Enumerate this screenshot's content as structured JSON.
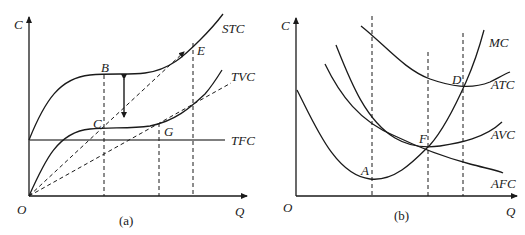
{
  "panel_a": {
    "caption": "(a)",
    "y_axis_label": "C",
    "x_axis_label": "Q",
    "origin_label": "O",
    "curves": {
      "stc": "STC",
      "tvc": "TVC",
      "tfc": "TFC"
    },
    "points": {
      "b": "B",
      "c": "C",
      "e": "E",
      "g": "G"
    }
  },
  "panel_b": {
    "caption": "(b)",
    "y_axis_label": "C",
    "x_axis_label": "Q",
    "origin_label": "O",
    "curves": {
      "mc": "MC",
      "atc": "ATC",
      "avc": "AVC",
      "afc": "AFC"
    },
    "points": {
      "a": "A",
      "d": "D",
      "f": "F"
    }
  }
}
